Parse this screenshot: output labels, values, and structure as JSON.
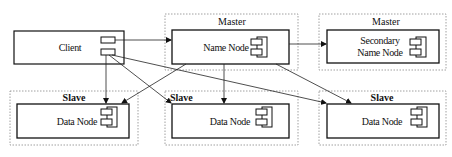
{
  "diagram": {
    "type": "architecture",
    "client": {
      "label": "Client"
    },
    "groups": [
      {
        "id": "master-1",
        "title": "Master",
        "node": "Name Node"
      },
      {
        "id": "master-2",
        "title": "Master",
        "node_line1": "Secondary",
        "node_line2": "Name Node"
      },
      {
        "id": "slave-1",
        "title": "Slave",
        "node": "Data Node"
      },
      {
        "id": "slave-2",
        "title": "Slave",
        "node": "Data Node"
      },
      {
        "id": "slave-3",
        "title": "Slave",
        "node": "Data Node"
      }
    ],
    "edges": [
      {
        "from": "Client",
        "to": "Name Node"
      },
      {
        "from": "Client",
        "to": "Data Node (slave-1)"
      },
      {
        "from": "Client",
        "to": "Data Node (slave-2)"
      },
      {
        "from": "Client",
        "to": "Data Node (slave-3)"
      },
      {
        "from": "Name Node",
        "to": "Secondary Name Node"
      },
      {
        "from": "Name Node",
        "to": "Data Node (slave-1)"
      },
      {
        "from": "Name Node",
        "to": "Data Node (slave-2)"
      },
      {
        "from": "Name Node",
        "to": "Data Node (slave-3)"
      }
    ]
  }
}
